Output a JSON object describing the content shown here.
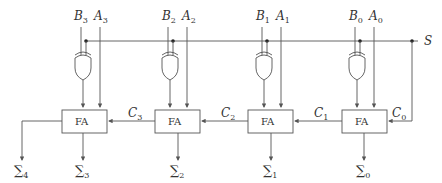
{
  "diagram": {
    "control": {
      "label": "S"
    },
    "stages": [
      {
        "b": "B",
        "b_sub": "3",
        "a": "A",
        "a_sub": "3",
        "block": "FA",
        "carry_in": "C",
        "carry_in_sub": "3",
        "sum": "∑",
        "sum_sub": "3"
      },
      {
        "b": "B",
        "b_sub": "2",
        "a": "A",
        "a_sub": "2",
        "block": "FA",
        "carry_in": "C",
        "carry_in_sub": "2",
        "sum": "∑",
        "sum_sub": "2"
      },
      {
        "b": "B",
        "b_sub": "1",
        "a": "A",
        "a_sub": "1",
        "block": "FA",
        "carry_in": "C",
        "carry_in_sub": "1",
        "sum": "∑",
        "sum_sub": "1"
      },
      {
        "b": "B",
        "b_sub": "0",
        "a": "A",
        "a_sub": "0",
        "block": "FA",
        "carry_in": "C",
        "carry_in_sub": "0",
        "sum": "∑",
        "sum_sub": "0"
      }
    ],
    "carry_out": {
      "sum": "∑",
      "sum_sub": "4"
    }
  }
}
